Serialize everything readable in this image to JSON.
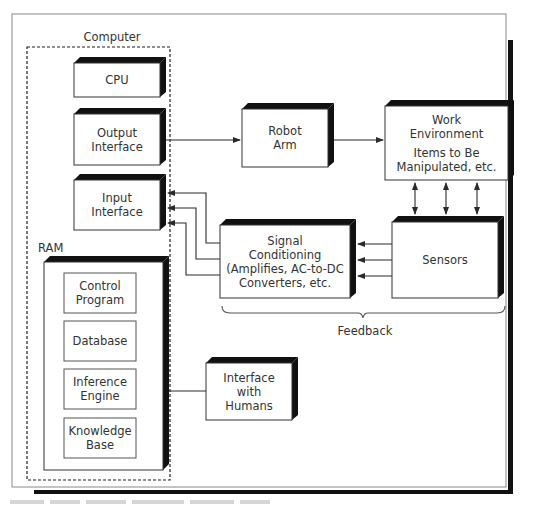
{
  "diagram": {
    "computer_group_label": "Computer",
    "ram_label": "RAM",
    "feedback_label": "Feedback",
    "blocks": {
      "cpu": [
        "CPU"
      ],
      "output_interface": [
        "Output",
        "Interface"
      ],
      "input_interface": [
        "Input",
        "Interface"
      ],
      "robot_arm": [
        "Robot",
        "Arm"
      ],
      "work_environment": [
        "Work",
        "Environment",
        "Items to Be",
        "Manipulated, etc."
      ],
      "signal_conditioning": [
        "Signal",
        "Conditioning",
        "(Amplifies, AC-to-DC",
        "Converters, etc."
      ],
      "sensors": [
        "Sensors"
      ],
      "interface_humans": [
        "Interface",
        "with",
        "Humans"
      ]
    },
    "ram_contents": [
      [
        "Control",
        "Program"
      ],
      [
        "Database"
      ],
      [
        "Inference",
        "Engine"
      ],
      [
        "Knowledge",
        "Base"
      ]
    ],
    "connections": [
      {
        "from": "output_interface",
        "to": "robot_arm",
        "type": "arrow"
      },
      {
        "from": "robot_arm",
        "to": "work_environment",
        "type": "arrow"
      },
      {
        "from": "sensors",
        "to": "work_environment",
        "type": "bidirectional",
        "count": 3
      },
      {
        "from": "sensors",
        "to": "signal_conditioning",
        "type": "arrow",
        "count": 3
      },
      {
        "from": "signal_conditioning",
        "to": "input_interface",
        "type": "arrow",
        "count": 3
      },
      {
        "from": "ram",
        "to": "interface_humans",
        "type": "line"
      }
    ],
    "colors": {
      "line": "#2a2a2a",
      "shadow": "#111111",
      "frame": "#888888"
    }
  }
}
